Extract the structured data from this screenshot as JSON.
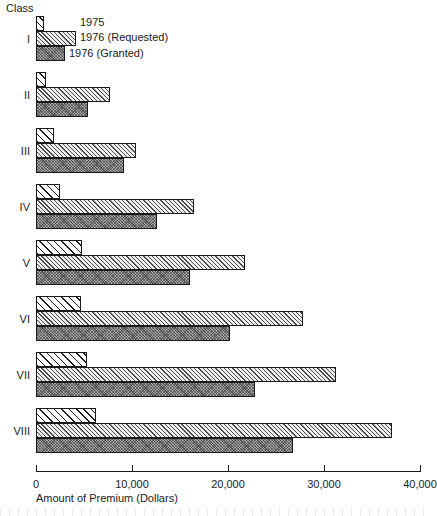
{
  "header": {
    "class_label": "Class"
  },
  "axis": {
    "x_title": "Amount of Premium (Dollars)",
    "ticks": [
      {
        "value": 0,
        "label": "0"
      },
      {
        "value": 10000,
        "label": "10,000"
      },
      {
        "value": 20000,
        "label": "20,000"
      },
      {
        "value": 30000,
        "label": "30,000"
      },
      {
        "value": 40000,
        "label": "40,000"
      }
    ]
  },
  "legend": {
    "items": [
      {
        "key": "y1975",
        "label": "1975"
      },
      {
        "key": "requested",
        "label": "1976 (Requested)"
      },
      {
        "key": "granted",
        "label": "1976 (Granted)"
      }
    ]
  },
  "chart_data": {
    "type": "bar",
    "orientation": "horizontal",
    "title": "",
    "xlabel": "Amount of Premium (Dollars)",
    "ylabel": "Class",
    "xlim": [
      0,
      40000
    ],
    "grid": false,
    "legend_position": "top-left (inline annotations on first group)",
    "categories": [
      "I",
      "II",
      "III",
      "IV",
      "V",
      "VI",
      "VII",
      "VIII"
    ],
    "series": [
      {
        "name": "1975",
        "values": [
          800,
          1000,
          1900,
          2500,
          4800,
          4700,
          5300,
          6200
        ]
      },
      {
        "name": "1976 (Requested)",
        "values": [
          4200,
          7700,
          10400,
          16500,
          21800,
          27800,
          31200,
          37100
        ]
      },
      {
        "name": "1976 (Granted)",
        "values": [
          3000,
          5400,
          9200,
          12600,
          16000,
          20200,
          22800,
          26800
        ]
      }
    ]
  }
}
